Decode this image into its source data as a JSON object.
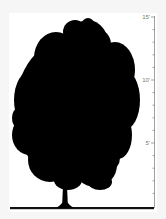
{
  "figure": {
    "colors": {
      "background": "#f6f6f6",
      "panel": "#ffffff",
      "silhouette": "#000000",
      "scale": "#8a8a8a"
    }
  },
  "scale": {
    "unit": "feet",
    "min": 0,
    "max": 15,
    "tick_step": 1,
    "labels": [
      {
        "value": 5,
        "text": "5'"
      },
      {
        "value": 10,
        "text": "10'"
      },
      {
        "value": 15,
        "text": "15'"
      }
    ]
  }
}
